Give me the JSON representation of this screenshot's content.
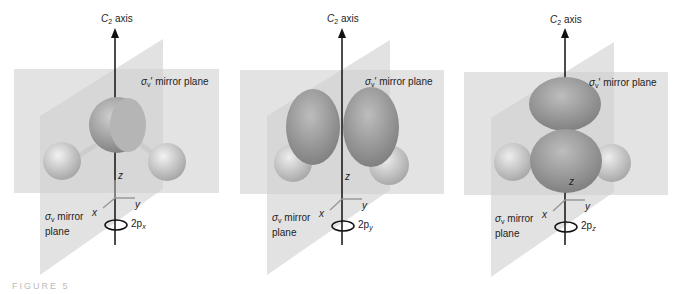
{
  "figure": {
    "caption": "FIGURE 5",
    "panels": [
      {
        "id": "2px",
        "axis_label": "C",
        "axis_sub": "2",
        "axis_suffix": " axis",
        "sigma_prime": "σ",
        "sigma_prime_sub": "v",
        "sigma_prime_suffix": "′ mirror plane",
        "sigma": "σ",
        "sigma_sub": "v",
        "sigma_suffix": " mirror",
        "sigma_line2": "plane",
        "z": "z",
        "y": "y",
        "x": "x",
        "orbital": "2p",
        "orbital_sub": "x"
      },
      {
        "id": "2py",
        "axis_label": "C",
        "axis_sub": "2",
        "axis_suffix": " axis",
        "sigma_prime": "σ",
        "sigma_prime_sub": "v",
        "sigma_prime_suffix": "′ mirror plane",
        "sigma": "σ",
        "sigma_sub": "v",
        "sigma_suffix": " mirror",
        "sigma_line2": "plane",
        "z": "z",
        "y": "y",
        "x": "x",
        "orbital": "2p",
        "orbital_sub": "y"
      },
      {
        "id": "2pz",
        "axis_label": "C",
        "axis_sub": "2",
        "axis_suffix": " axis",
        "sigma_prime": "σ",
        "sigma_prime_sub": "v",
        "sigma_prime_suffix": "′ mirror plane",
        "sigma": "σ",
        "sigma_sub": "v",
        "sigma_suffix": " mirror",
        "sigma_line2": "plane",
        "z": "z",
        "y": "y",
        "x": "x",
        "orbital": "2p",
        "orbital_sub": "z"
      }
    ]
  }
}
